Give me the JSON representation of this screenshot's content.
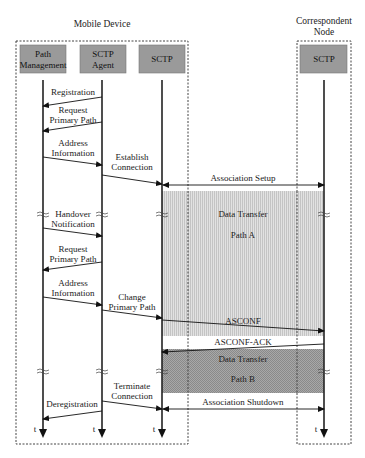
{
  "groups": {
    "mobile_device": {
      "title": "Mobile Device"
    },
    "correspondent_node": {
      "title_line1": "Correspondent",
      "title_line2": "Node"
    }
  },
  "entities": {
    "path_management": {
      "line1": "Path",
      "line2": "Management"
    },
    "sctp_agent": {
      "line1": "SCTP",
      "line2": "Agent"
    },
    "sctp_mobile": {
      "label": "SCTP"
    },
    "sctp_correspondent": {
      "label": "SCTP"
    }
  },
  "messages": {
    "registration": {
      "line1": "Registration"
    },
    "request_primary_path_1": {
      "line1": "Request",
      "line2": "Primary Path"
    },
    "address_information_1": {
      "line1": "Address",
      "line2": "Information"
    },
    "establish_connection": {
      "line1": "Establish",
      "line2": "Connection"
    },
    "association_setup": {
      "line1": "Association Setup"
    },
    "handover_notification": {
      "line1": "Handover",
      "line2": "Notification"
    },
    "request_primary_path_2": {
      "line1": "Request",
      "line2": "Primary Path"
    },
    "address_information_2": {
      "line1": "Address",
      "line2": "Information"
    },
    "change_primary_path": {
      "line1": "Change",
      "line2": "Primary Path"
    },
    "asconf": {
      "line1": "ASCONF"
    },
    "asconf_ack": {
      "line1": "ASCONF-ACK"
    },
    "terminate_connection": {
      "line1": "Terminate",
      "line2": "Connection"
    },
    "deregistration": {
      "line1": "Deregistration"
    },
    "association_shutdown": {
      "line1": "Association Shutdown"
    }
  },
  "regions": {
    "path_a": {
      "line1": "Data Transfer",
      "line2": "Path A"
    },
    "path_b": {
      "line1": "Data Transfer",
      "line2": "Path B"
    }
  },
  "time_label": "t",
  "colors": {
    "entity_box": "#9a9a9a",
    "path_a_fill": "#d6d6d6",
    "path_b_fill": "#9c9c9c",
    "line": "#222222"
  }
}
